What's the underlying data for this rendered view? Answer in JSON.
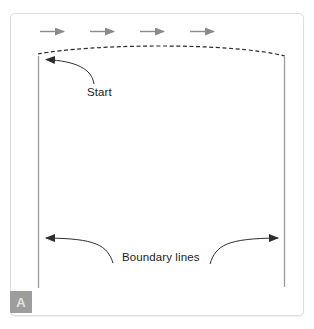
{
  "figure": {
    "panel_label": "A",
    "labels": {
      "start": "Start",
      "boundary_lines": "Boundary lines"
    },
    "direction_arrows": {
      "count": 4,
      "direction": "right",
      "icon": "right-arrow-icon"
    },
    "annotations": [
      {
        "target": "top-left-corner",
        "label": "Start"
      },
      {
        "target": "left-boundary-line",
        "label": "Boundary lines"
      },
      {
        "target": "right-boundary-line",
        "label": "Boundary lines"
      }
    ],
    "paths": {
      "top_edge_style": "dashed",
      "side_edges_style": "solid"
    }
  },
  "colors": {
    "frame_border": "#dcdcdc",
    "direction_arrow": "#8a8a8a",
    "dashed_path": "#2b2b2b",
    "boundary_line": "#9a9a9a",
    "annotation_arrow": "#2e2e2e",
    "panel_badge_bg": "#9d9d9d",
    "panel_badge_text": "#e3e3e3",
    "label_text": "#1c1c1c"
  }
}
